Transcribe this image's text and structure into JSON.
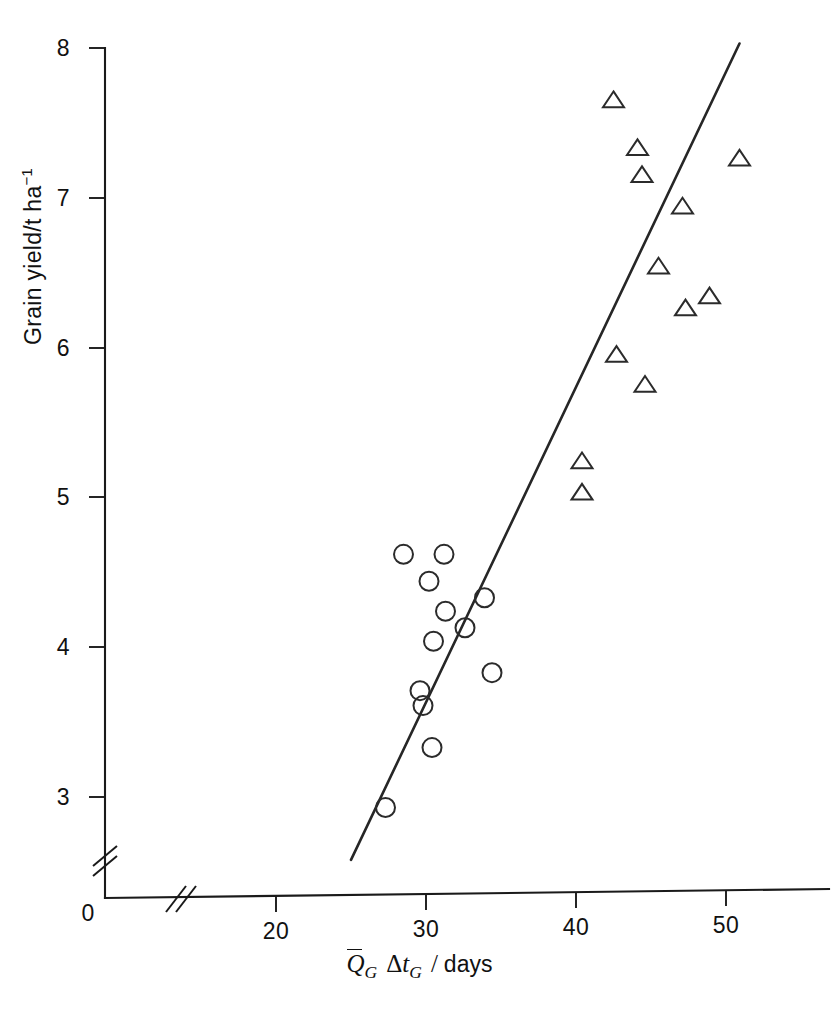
{
  "chart_data": {
    "type": "scatter",
    "title": "",
    "xlabel": "Q̄_G Δt_G / days",
    "ylabel": "Grain yield/t ha⁻¹",
    "xlim": [
      14.5,
      56.5
    ],
    "ylim": [
      2.45,
      8.1
    ],
    "xticks": [
      20,
      30,
      40,
      50
    ],
    "xtick_labels": [
      "20",
      "30",
      "40",
      "50"
    ],
    "yticks": [
      3,
      4,
      5,
      6,
      7,
      8
    ],
    "ytick_labels": [
      "3",
      "4",
      "5",
      "6",
      "7",
      "8"
    ],
    "origin_label": "0",
    "grid": false,
    "legend": "none",
    "axis_breaks": {
      "x_break_at": 16.5,
      "y_break_at": 2.7,
      "style": "double-slash"
    },
    "series": [
      {
        "name": "circles",
        "marker": "open-circle",
        "points": [
          {
            "x": 27.3,
            "y": 2.93
          },
          {
            "x": 28.5,
            "y": 4.62
          },
          {
            "x": 29.6,
            "y": 3.71
          },
          {
            "x": 29.8,
            "y": 3.61
          },
          {
            "x": 30.2,
            "y": 4.44
          },
          {
            "x": 30.4,
            "y": 3.33
          },
          {
            "x": 30.5,
            "y": 4.04
          },
          {
            "x": 31.2,
            "y": 4.62
          },
          {
            "x": 31.3,
            "y": 4.24
          },
          {
            "x": 32.6,
            "y": 4.13
          },
          {
            "x": 33.9,
            "y": 4.33
          },
          {
            "x": 34.4,
            "y": 3.83
          }
        ]
      },
      {
        "name": "triangles",
        "marker": "open-triangle",
        "points": [
          {
            "x": 40.4,
            "y": 5.24
          },
          {
            "x": 40.4,
            "y": 5.03
          },
          {
            "x": 42.5,
            "y": 7.65
          },
          {
            "x": 42.7,
            "y": 5.95
          },
          {
            "x": 44.1,
            "y": 7.33
          },
          {
            "x": 44.4,
            "y": 7.15
          },
          {
            "x": 44.6,
            "y": 5.75
          },
          {
            "x": 45.5,
            "y": 6.54
          },
          {
            "x": 47.1,
            "y": 6.94
          },
          {
            "x": 47.3,
            "y": 6.26
          },
          {
            "x": 48.9,
            "y": 6.34
          },
          {
            "x": 50.9,
            "y": 7.26
          }
        ]
      }
    ],
    "fit_line": {
      "name": "regression-line",
      "x0": 25.0,
      "y0": 2.58,
      "x1": 50.9,
      "y1": 8.03
    }
  },
  "axis_titles": {
    "y": {
      "text_main": "Grain yield/t ha",
      "exponent": "−1"
    },
    "x": {
      "q_symbol": "Q",
      "q_subscript": "G",
      "delta": "Δ",
      "t_symbol": "t",
      "t_subscript": "G",
      "separator": "/",
      "unit": "days"
    }
  }
}
